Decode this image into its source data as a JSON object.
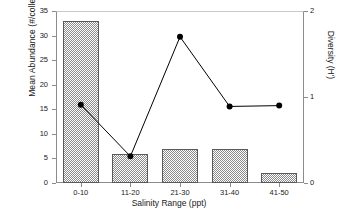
{
  "chart_data": {
    "type": "bar",
    "title": "",
    "xlabel": "Salinity Range (ppt)",
    "ylabel": "Mean Abundance (#/collection)",
    "y2label": "Diversity (H')",
    "categories": [
      "0-10",
      "11-20",
      "21-30",
      "31-40",
      "41-50"
    ],
    "grid": false,
    "legend": "none",
    "ylim": [
      0,
      35
    ],
    "y2lim": [
      0,
      2
    ],
    "yticks": [
      0,
      5,
      10,
      15,
      20,
      25,
      30,
      35
    ],
    "ytick_labels": [
      "0",
      "5",
      "10",
      "15",
      "20",
      "25",
      "30",
      "35"
    ],
    "y2ticks": [
      0,
      1,
      2
    ],
    "y2tick_labels": [
      "0",
      "1",
      "2"
    ],
    "series": [
      {
        "name": "Mean Abundance (#/collection)",
        "type": "bar",
        "axis": "left",
        "color": "#8a8a8a",
        "values": [
          33,
          6,
          7,
          7,
          2
        ]
      },
      {
        "name": "Diversity (H')",
        "type": "line",
        "axis": "right",
        "color": "#000000",
        "values": [
          0.91,
          0.31,
          1.7,
          0.89,
          0.9
        ]
      }
    ]
  },
  "axes": {
    "left_title": "Mean Abundance (#/collection)",
    "right_title": "Diversity (H')",
    "x_title": "Salinity Range (ppt)"
  }
}
